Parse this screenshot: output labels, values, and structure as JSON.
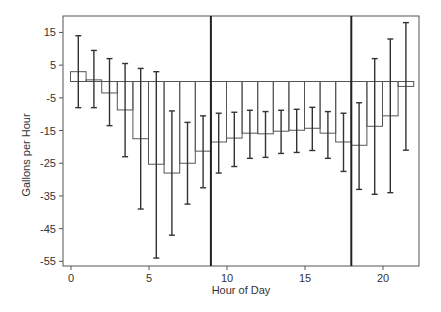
{
  "chart_data": {
    "type": "bar",
    "title": "",
    "xlabel": "Hour of Day",
    "ylabel": "Gallons per Hour",
    "xlim": [
      -0.5,
      22.5
    ],
    "ylim": [
      -56.5,
      19.5
    ],
    "xticks": [
      0,
      5,
      10,
      15,
      20
    ],
    "yticks": [
      15,
      5,
      -5,
      -15,
      -25,
      -35,
      -45,
      -55
    ],
    "xtick_labels": [
      "0",
      "5",
      "10",
      "15",
      "20"
    ],
    "ytick_labels": [
      "15",
      "5",
      "-5",
      "-15",
      "-25",
      "-35",
      "-45",
      "-55"
    ],
    "grid": false,
    "legend": null,
    "vertical_lines": [
      9,
      18
    ],
    "bar_style": "outlined step bars spanning each hour with error bars at bar centers",
    "categories": [
      0,
      1,
      2,
      3,
      4,
      5,
      6,
      7,
      8,
      9,
      10,
      11,
      12,
      13,
      14,
      15,
      16,
      17,
      18,
      19,
      20,
      21
    ],
    "series": [
      {
        "name": "mean",
        "values": [
          3,
          0.5,
          -3.5,
          -8.7,
          -17.5,
          -25.3,
          -28,
          -25,
          -21.3,
          -18.5,
          -17.3,
          -15.8,
          -16,
          -15.2,
          -14.9,
          -14.3,
          -15.8,
          -18.5,
          -19.5,
          -13.7,
          -10.5,
          -1.5
        ]
      },
      {
        "name": "error_upper",
        "values": [
          14,
          9.5,
          7,
          5.5,
          4,
          3,
          -9,
          -12.5,
          -10.5,
          -9.7,
          -9.4,
          -8.8,
          -9.2,
          -8.8,
          -8.5,
          -7.9,
          -9.2,
          -9.7,
          -6.5,
          7,
          13,
          18
        ]
      },
      {
        "name": "error_lower",
        "values": [
          -8,
          -8,
          -13.5,
          -23,
          -39,
          -54,
          -47,
          -37.5,
          -32.5,
          -28,
          -26,
          -23.5,
          -23.2,
          -22,
          -21.7,
          -21.1,
          -23.5,
          -27.5,
          -33,
          -34.5,
          -34,
          -21
        ]
      }
    ]
  },
  "colors": {
    "bar_edge": "#555555",
    "error_bar": "#333333",
    "axis": "#555555",
    "divider": "#222222",
    "text": "#333333"
  }
}
